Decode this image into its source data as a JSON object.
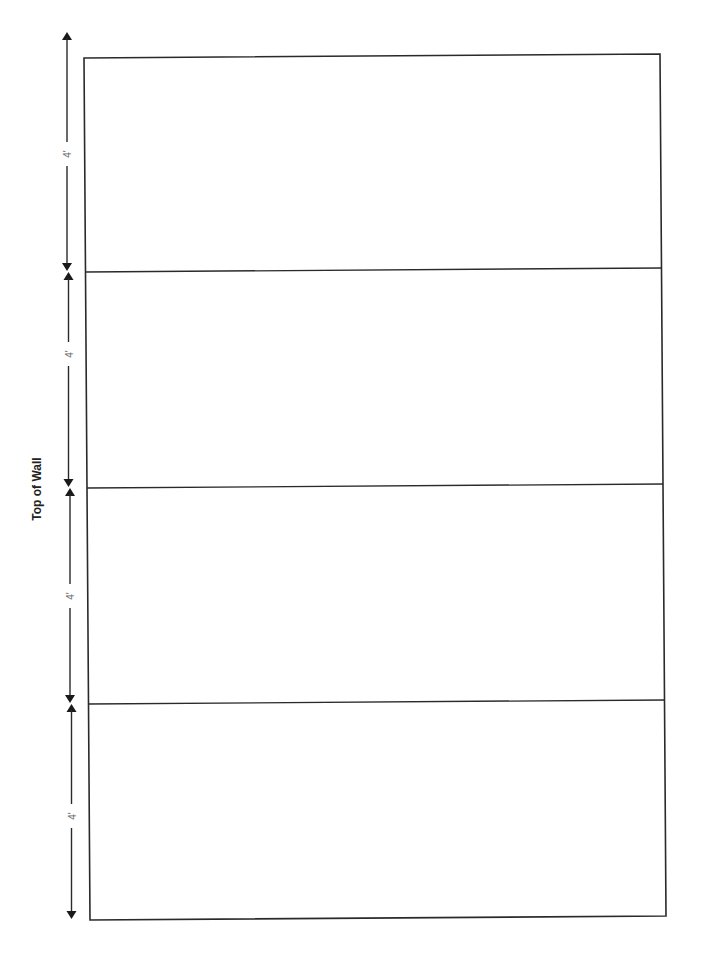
{
  "diagram": {
    "title": "Top of Wall",
    "segment_labels": [
      "4'",
      "4'",
      "4'",
      "4'"
    ],
    "colors": {
      "line": "#2a2a2a",
      "label": "#666666",
      "title": "#222222",
      "background": "#ffffff"
    },
    "panel_count": 4,
    "panel_height": "4'"
  }
}
